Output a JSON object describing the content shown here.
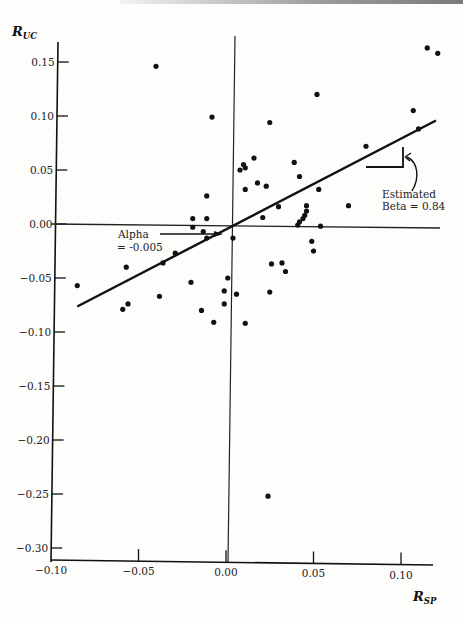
{
  "chart_data": {
    "type": "scatter",
    "title": "",
    "xlabel": "R_SP",
    "ylabel": "R_UC",
    "xlabel_main": "R",
    "xlabel_sub": "SP",
    "ylabel_main": "R",
    "ylabel_sub": "UC",
    "xlim": [
      -0.1,
      0.12
    ],
    "ylim": [
      -0.31,
      0.17
    ],
    "x_ticks": [
      -0.1,
      -0.05,
      0.0,
      0.05,
      0.1
    ],
    "x_tick_labels": [
      "-0.10",
      "-0.05",
      "0.00",
      "0.05",
      "0.10"
    ],
    "y_ticks": [
      0.15,
      0.1,
      0.05,
      0.0,
      -0.05,
      -0.1,
      -0.15,
      -0.2,
      -0.25,
      -0.3
    ],
    "y_tick_labels": [
      "0.15",
      "0.10",
      "0.05",
      "0.00",
      "-0.05",
      "-0.10",
      "-0.15",
      "-0.20",
      "-0.25",
      "-0.30"
    ],
    "grid": false,
    "legend": null,
    "reference_lines": {
      "x0": 0.0,
      "y0": 0.0
    },
    "regression_line": {
      "alpha": -0.005,
      "beta": 0.84,
      "x_start": -0.085,
      "x_end": 0.12
    },
    "annotations": [
      {
        "text_line1": "Alpha",
        "text_line2": "= -0.005",
        "points_to": [
          0.0,
          -0.005
        ]
      },
      {
        "text_line1": "Estimated",
        "text_line2": "Beta = 0.84",
        "points_to": "slope triangle"
      }
    ],
    "series": [
      {
        "name": "monthly returns",
        "points": [
          [
            -0.04,
            0.146
          ],
          [
            -0.008,
            0.099
          ],
          [
            0.025,
            0.094
          ],
          [
            0.052,
            0.12
          ],
          [
            0.115,
            0.163
          ],
          [
            0.121,
            0.158
          ],
          [
            0.107,
            0.105
          ],
          [
            0.11,
            0.088
          ],
          [
            0.08,
            0.072
          ],
          [
            0.008,
            0.05
          ],
          [
            0.01,
            0.055
          ],
          [
            0.011,
            0.052
          ],
          [
            0.016,
            0.061
          ],
          [
            0.011,
            0.032
          ],
          [
            0.018,
            0.038
          ],
          [
            0.023,
            0.035
          ],
          [
            0.039,
            0.057
          ],
          [
            0.042,
            0.044
          ],
          [
            0.03,
            0.016
          ],
          [
            0.021,
            0.006
          ],
          [
            0.053,
            0.032
          ],
          [
            0.046,
            0.017
          ],
          [
            0.046,
            0.012
          ],
          [
            0.045,
            0.008
          ],
          [
            0.044,
            0.005
          ],
          [
            0.042,
            0.002
          ],
          [
            0.041,
            -0.001
          ],
          [
            0.054,
            -0.002
          ],
          [
            0.07,
            0.017
          ],
          [
            0.049,
            -0.016
          ],
          [
            0.05,
            -0.025
          ],
          [
            0.032,
            -0.036
          ],
          [
            0.026,
            -0.037
          ],
          [
            0.034,
            -0.044
          ],
          [
            -0.011,
            0.026
          ],
          [
            -0.011,
            0.005
          ],
          [
            -0.019,
            0.005
          ],
          [
            -0.019,
            -0.003
          ],
          [
            -0.013,
            -0.007
          ],
          [
            -0.011,
            -0.013
          ],
          [
            0.004,
            -0.013
          ],
          [
            -0.029,
            -0.027
          ],
          [
            -0.036,
            -0.036
          ],
          [
            -0.085,
            -0.057
          ],
          [
            -0.057,
            -0.04
          ],
          [
            -0.059,
            -0.079
          ],
          [
            -0.056,
            -0.074
          ],
          [
            -0.038,
            -0.067
          ],
          [
            -0.02,
            -0.054
          ],
          [
            -0.014,
            -0.08
          ],
          [
            -0.007,
            -0.091
          ],
          [
            0.001,
            -0.05
          ],
          [
            -0.001,
            -0.062
          ],
          [
            -0.001,
            -0.074
          ],
          [
            0.006,
            -0.065
          ],
          [
            0.011,
            -0.092
          ],
          [
            0.025,
            -0.063
          ],
          [
            0.024,
            -0.252
          ]
        ]
      }
    ]
  }
}
